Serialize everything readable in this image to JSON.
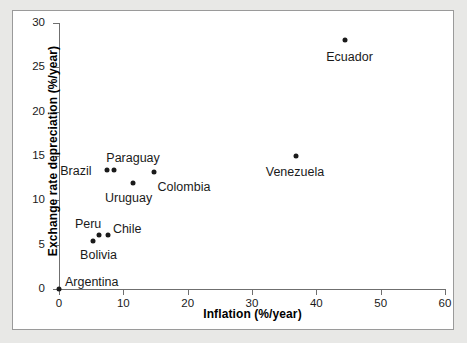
{
  "chart_data": {
    "type": "scatter",
    "title": "",
    "xlabel": "Inflation (%/year)",
    "ylabel": "Exchange rate depreciation (%/year)",
    "xlim": [
      0,
      60
    ],
    "ylim": [
      0,
      30
    ],
    "xticks": [
      0,
      10,
      20,
      30,
      40,
      50,
      60
    ],
    "yticks": [
      0,
      5,
      10,
      15,
      20,
      25,
      30
    ],
    "grid": false,
    "legend": "none",
    "marker_color": "#1a1a1a",
    "points": [
      {
        "label": "Argentina",
        "x": 0.0,
        "y": 0.0,
        "label_dx": 6,
        "label_dy": -13
      },
      {
        "label": "Bolivia",
        "x": 5.3,
        "y": 5.4,
        "label_dx": -13,
        "label_dy": 8
      },
      {
        "label": "Peru",
        "x": 6.2,
        "y": 6.1,
        "label_dx": -24,
        "label_dy": -17
      },
      {
        "label": "Chile",
        "x": 7.6,
        "y": 6.1,
        "label_dx": 5,
        "label_dy": -12
      },
      {
        "label": "Brazil",
        "x": 7.5,
        "y": 13.4,
        "label_dx": -47,
        "label_dy": -5
      },
      {
        "label": "Paraguay",
        "x": 8.6,
        "y": 13.4,
        "label_dx": -8,
        "label_dy": -18
      },
      {
        "label": "Uruguay",
        "x": 11.5,
        "y": 12.0,
        "label_dx": -28,
        "label_dy": 9
      },
      {
        "label": "Colombia",
        "x": 14.7,
        "y": 13.2,
        "label_dx": 4,
        "label_dy": 9
      },
      {
        "label": "Venezuela",
        "x": 36.8,
        "y": 15.0,
        "label_dx": -30,
        "label_dy": 10
      },
      {
        "label": "Ecuador",
        "x": 44.5,
        "y": 28.1,
        "label_dx": -19,
        "label_dy": 11
      }
    ]
  }
}
